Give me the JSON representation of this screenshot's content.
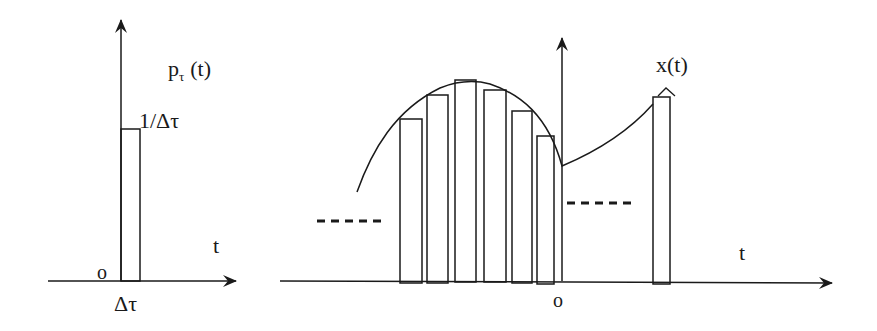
{
  "left_panel": {
    "function_label": "p",
    "function_subscript": "τ",
    "function_arg": "(t)",
    "height_label": "1/Δτ",
    "axis_label": "t",
    "origin_label": "o",
    "width_label": "Δτ"
  },
  "right_panel": {
    "function_label": "x(t)",
    "axis_label": "t",
    "origin_label": "o",
    "bars": [
      {
        "x": 400,
        "w": 22,
        "top": 119
      },
      {
        "x": 427,
        "w": 21,
        "top": 95
      },
      {
        "x": 455,
        "w": 21,
        "top": 80
      },
      {
        "x": 484,
        "w": 22,
        "top": 90
      },
      {
        "x": 512,
        "w": 20,
        "top": 111
      },
      {
        "x": 537,
        "w": 17,
        "top": 136
      },
      {
        "x": 653,
        "w": 17,
        "top": 97
      }
    ],
    "ellipsis_left": "- - - - -",
    "ellipsis_right": "- - - - -"
  },
  "colors": {
    "stroke": "#1a1a1a",
    "background": "#ffffff"
  }
}
